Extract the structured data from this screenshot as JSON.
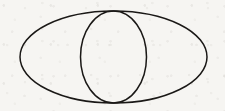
{
  "figure": {
    "title": "Two concentric tangent ellipses",
    "canvas": {
      "width": 225,
      "height": 111,
      "background_color": "#f6f5f2",
      "paper_texture": "scanned-paper-grain"
    },
    "stroke": {
      "color": "#1a1816",
      "width": 1.5,
      "style": "hand-drawn-scanned"
    },
    "shapes": [
      {
        "name": "outer-ellipse",
        "type": "ellipse",
        "center_x": 113.5,
        "center_y": 57,
        "radius_x": 93.5,
        "radius_y": 46,
        "left_vertex_x": 20,
        "right_vertex_x": 207,
        "top_vertex_y": 11,
        "bottom_vertex_y": 103,
        "stroke_color": "#1a1816",
        "stroke_width": 1.5,
        "fill": "none"
      },
      {
        "name": "inner-ellipse",
        "type": "ellipse",
        "center_x": 113.5,
        "center_y": 57,
        "radius_x": 33,
        "radius_y": 46,
        "left_vertex_x": 80.5,
        "right_vertex_x": 146.5,
        "top_vertex_y": 11,
        "bottom_vertex_y": 103,
        "stroke_color": "#1a1816",
        "stroke_width": 1.5,
        "fill": "none"
      }
    ],
    "tangent_points": [
      {
        "name": "top-tangent-point",
        "x": 113.5,
        "y": 11
      },
      {
        "name": "bottom-tangent-point",
        "x": 113.5,
        "y": 103
      }
    ]
  }
}
